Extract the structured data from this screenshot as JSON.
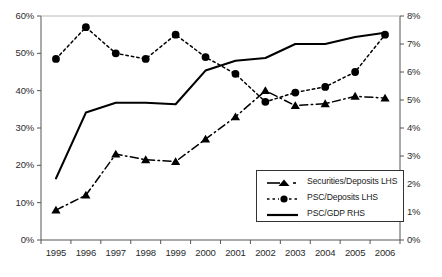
{
  "chart_data": {
    "type": "line",
    "title": "",
    "xlabel": "",
    "ylabel": "",
    "categories": [
      "1995",
      "1996",
      "1997",
      "1998",
      "1999",
      "2000",
      "2001",
      "2002",
      "2003",
      "2004",
      "2005",
      "2006"
    ],
    "left_axis": {
      "label": "",
      "ticks": [
        "0%",
        "10%",
        "20%",
        "30%",
        "40%",
        "50%",
        "60%"
      ],
      "tick_values": [
        0,
        10,
        20,
        30,
        40,
        50,
        60
      ],
      "ylim": [
        0,
        60
      ]
    },
    "right_axis": {
      "label": "",
      "ticks": [
        "0%",
        "1%",
        "2%",
        "3%",
        "4%",
        "5%",
        "6%",
        "7%",
        "8%"
      ],
      "tick_values": [
        0,
        1,
        2,
        3,
        4,
        5,
        6,
        7,
        8
      ],
      "ylim": [
        0,
        8
      ]
    },
    "grid": false,
    "legend_position": "inside-bottom-right",
    "series": [
      {
        "name": "Securities/Deposits LHS",
        "axis": "left",
        "marker": "triangle",
        "style": "dash-dot",
        "values": [
          8,
          12,
          23,
          21.5,
          21,
          27,
          33,
          40,
          36,
          36.5,
          38.5,
          38
        ]
      },
      {
        "name": "PSC/Deposits LHS",
        "axis": "left",
        "marker": "circle",
        "style": "dotted",
        "values": [
          48.5,
          57,
          50,
          48.5,
          55,
          49,
          44.5,
          37,
          39.5,
          41,
          45,
          55
        ]
      },
      {
        "name": "PSC/GDP RHS",
        "axis": "right",
        "marker": "none",
        "style": "solid",
        "values": [
          2.2,
          4.55,
          4.9,
          4.9,
          4.85,
          6.05,
          6.4,
          6.5,
          7.0,
          7.0,
          7.25,
          7.4
        ]
      }
    ]
  },
  "legend": {
    "items": [
      {
        "label": "Securities/Deposits LHS"
      },
      {
        "label": "PSC/Deposits LHS"
      },
      {
        "label": "PSC/GDP RHS"
      }
    ]
  },
  "colors": {
    "series_line": "#000000",
    "axis": "#555555",
    "text": "#1a1a1a",
    "background": "#ffffff"
  }
}
